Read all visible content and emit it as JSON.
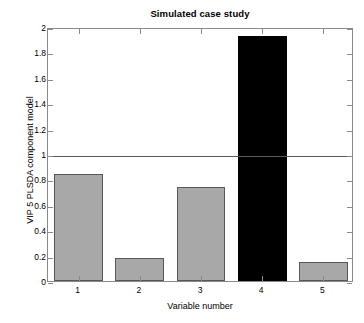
{
  "chart_data": {
    "type": "bar",
    "title": "Simulated case study",
    "xlabel": "Variable number",
    "ylabel": "VIP 5 PLSDA component model",
    "categories": [
      "1",
      "2",
      "3",
      "4",
      "5"
    ],
    "values": [
      0.84,
      0.18,
      0.74,
      1.93,
      0.15
    ],
    "bar_colors": [
      "#a8a8a8",
      "#a8a8a8",
      "#a8a8a8",
      "#000000",
      "#a8a8a8"
    ],
    "bar_edge_color": "#3c3c3c",
    "highlight_index": 3,
    "highlight_color": "#000000",
    "default_color": "#a8a8a8",
    "ylim": [
      0,
      2
    ],
    "xlim": [
      0.5,
      5.5
    ],
    "ytick_labels": [
      "0",
      "0.2",
      "0.4",
      "0.6",
      "0.8",
      "1",
      "1.2",
      "1.4",
      "1.6",
      "1.8",
      "2"
    ],
    "ytick_values": [
      0,
      0.2,
      0.4,
      0.6,
      0.8,
      1,
      1.2,
      1.4,
      1.6,
      1.8,
      2
    ],
    "xtick_labels": [
      "1",
      "2",
      "3",
      "4",
      "5"
    ],
    "xtick_values": [
      1,
      2,
      3,
      4,
      5
    ],
    "grid": false,
    "legend": null,
    "reference_line": {
      "value": 1,
      "color": "#5a5a5a",
      "label": ""
    },
    "axis_color": "#8a8a8a",
    "background": "#ffffff"
  }
}
